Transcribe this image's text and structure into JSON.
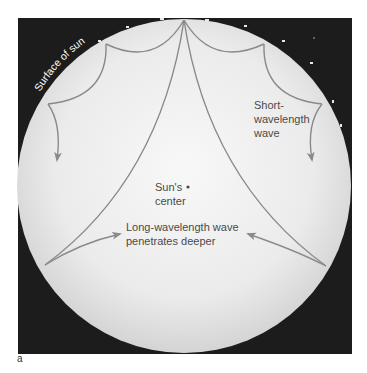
{
  "figure": {
    "panel_label": "a",
    "colors": {
      "background": "#ffffff",
      "space": "#1c1c1c",
      "sun_center": "#f7f7f7",
      "sun_edge": "#d6d6d6",
      "wave_path": "#8a8a8a",
      "text": "#4a4a4a",
      "surface_label": "#ffffff"
    },
    "labels": {
      "surface": "Surface of sun",
      "short_wave_line1": "Short-",
      "short_wave_line2": "wavelength",
      "short_wave_line3": "wave",
      "center_line1": "Sun's",
      "center_line2": "center",
      "long_wave_line1": "Long-wavelength wave",
      "long_wave_line2": "penetrates deeper"
    },
    "elements": [
      {
        "name": "sun-disc",
        "shape": "circle"
      },
      {
        "name": "short-wavelength-wave",
        "type": "curved path with bounces",
        "bounces": 4
      },
      {
        "name": "long-wavelength-wave",
        "type": "curved path",
        "paths": 2
      },
      {
        "name": "sun-center-dot",
        "shape": "dot"
      }
    ]
  }
}
